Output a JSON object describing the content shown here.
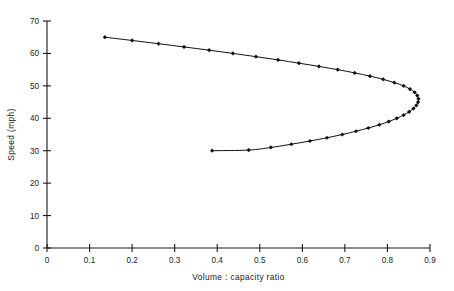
{
  "chart_data": {
    "type": "line",
    "title": "",
    "xlabel": "Volume : capacity ratio",
    "ylabel": "Speed (mph)",
    "xlim": [
      0,
      0.9
    ],
    "ylim": [
      0,
      70
    ],
    "xticks": [
      0,
      0.1,
      0.2,
      0.3,
      0.4,
      0.5,
      0.6,
      0.7,
      0.8,
      0.9
    ],
    "xtick_labels": [
      "0",
      "0.1",
      "0.2",
      "0.3",
      "0.4",
      "0.5",
      "0.6",
      "0.7",
      "0.8",
      "0.9"
    ],
    "yticks": [
      0,
      10,
      20,
      30,
      40,
      50,
      60,
      70
    ],
    "ytick_labels": [
      "0",
      "10",
      "20",
      "30",
      "40",
      "50",
      "60",
      "70"
    ],
    "grid": false,
    "legend": "none",
    "marker": "diamond",
    "marker_color": "#111111",
    "line_color": "#111111",
    "series": [
      {
        "name": "Speed-flow curve",
        "points": [
          [
            0.136,
            65.0
          ],
          [
            0.2,
            64.0
          ],
          [
            0.262,
            63.0
          ],
          [
            0.322,
            62.0
          ],
          [
            0.381,
            61.0
          ],
          [
            0.437,
            60.0
          ],
          [
            0.491,
            59.0
          ],
          [
            0.543,
            58.0
          ],
          [
            0.592,
            57.0
          ],
          [
            0.639,
            56.0
          ],
          [
            0.683,
            55.0
          ],
          [
            0.723,
            54.0
          ],
          [
            0.759,
            53.0
          ],
          [
            0.79,
            52.0
          ],
          [
            0.816,
            51.0
          ],
          [
            0.838,
            50.0
          ],
          [
            0.853,
            49.0
          ],
          [
            0.864,
            48.0
          ],
          [
            0.87,
            47.0
          ],
          [
            0.873,
            46.0
          ],
          [
            0.872,
            45.0
          ],
          [
            0.868,
            44.0
          ],
          [
            0.861,
            43.0
          ],
          [
            0.851,
            42.0
          ],
          [
            0.838,
            41.0
          ],
          [
            0.822,
            40.0
          ],
          [
            0.803,
            39.0
          ],
          [
            0.781,
            38.0
          ],
          [
            0.755,
            37.0
          ],
          [
            0.726,
            36.0
          ],
          [
            0.694,
            35.0
          ],
          [
            0.658,
            34.0
          ],
          [
            0.618,
            33.0
          ],
          [
            0.574,
            32.0
          ],
          [
            0.526,
            31.0
          ],
          [
            0.474,
            30.2
          ],
          [
            0.388,
            30.0
          ]
        ]
      }
    ]
  }
}
